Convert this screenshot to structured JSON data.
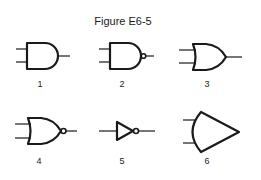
{
  "figure": {
    "title": "Figure E6-5",
    "gates": [
      {
        "number": "1",
        "type": "AND"
      },
      {
        "number": "2",
        "type": "NAND"
      },
      {
        "number": "3",
        "type": "OR"
      },
      {
        "number": "4",
        "type": "NOR"
      },
      {
        "number": "5",
        "type": "NOT"
      },
      {
        "number": "6",
        "type": "OR-large"
      }
    ],
    "colors": {
      "ink": "#1a1a1a",
      "background": "#ffffff"
    }
  }
}
